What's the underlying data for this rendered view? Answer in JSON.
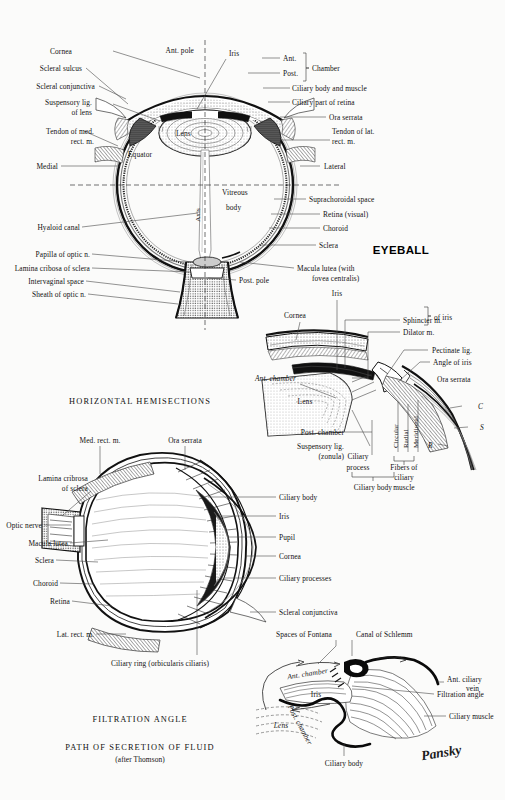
{
  "page": {
    "background": "#fbfbfa",
    "ink": "#111111",
    "signature": "Pansky"
  },
  "titles": {
    "eyeball": "EYEBALL",
    "horizontal_hemisections": "HORIZONTAL  HEMISECTIONS",
    "filtration_angle": "FILTRATION  ANGLE",
    "path_of_secretion": "PATH  OF  SECRETION  OF  FLUID",
    "after_thomson": "(after Thomson)"
  },
  "fig_eyeball": {
    "name": "eyeball-horizontal-section",
    "left_labels": [
      "Cornea",
      "Scleral sulcus",
      "Scleral conjunctiva",
      "Suspensory lig.",
      "of lens",
      "Tendon of med.",
      "rect. m.",
      "Medial",
      "Hyaloid canal",
      "Papilla of optic n.",
      "Lamina cribosa of sclera",
      "Intervaginal space",
      "Sheath of optic n."
    ],
    "right_labels": [
      "Ant.",
      "Post.",
      "Chamber",
      "Ciliary body and muscle",
      "Ciliary part of retina",
      "Ora serrata",
      "Tendon of lat.",
      "rect. m.",
      "Lateral",
      "Suprachoroidal space",
      "Retina (visual)",
      "Choroid",
      "Sclera",
      "Macula lutea (with",
      "fovea centralis)"
    ],
    "inner_labels": [
      "Ant. pole",
      "Iris",
      "Lens",
      "Equator",
      "Axis",
      "Vitreous",
      "body",
      "Post. pole"
    ]
  },
  "fig_ciliary": {
    "name": "ciliary-body-detail",
    "labels": [
      "Cornea",
      "Iris",
      "Sphincter m.",
      "Dilator m.",
      "of iris",
      "Pectinate lig.",
      "Angle of iris",
      "Ant. chamber",
      "Lens",
      "Ora serrata",
      "Post. chamber",
      "Suspensory lig.",
      "(zonula)",
      "Ciliary",
      "process",
      "Circular",
      "Radial",
      "Meridional",
      "Fibers of",
      "ciliary",
      "muscle",
      "Ciliary body",
      "C",
      "S",
      "R"
    ]
  },
  "fig_sagittal": {
    "name": "eye-hemisection-anterior",
    "left_labels": [
      "Med. rect. m.",
      "Ora serrata",
      "Lamina cribrosa",
      "of sclera",
      "Optic nerve",
      "Macula lutea",
      "Sclera",
      "Choroid",
      "Retina",
      "Lat. rect. m.",
      "Ciliary ring (orbicularis ciliaris)"
    ],
    "right_labels": [
      "Ciliary body",
      "Iris",
      "Pupil",
      "Cornea",
      "Ciliary processes",
      "Scleral conjunctiva"
    ]
  },
  "fig_filtration": {
    "name": "filtration-angle-detail",
    "labels": [
      "Spaces of Fontana",
      "Canal of Schlemm",
      "Ant. ciliary",
      "vein",
      "Filtration angle",
      "Ant. chamber",
      "Iris",
      "Post. chamber",
      "Lens",
      "Ciliary muscle",
      "Ciliary body"
    ]
  }
}
